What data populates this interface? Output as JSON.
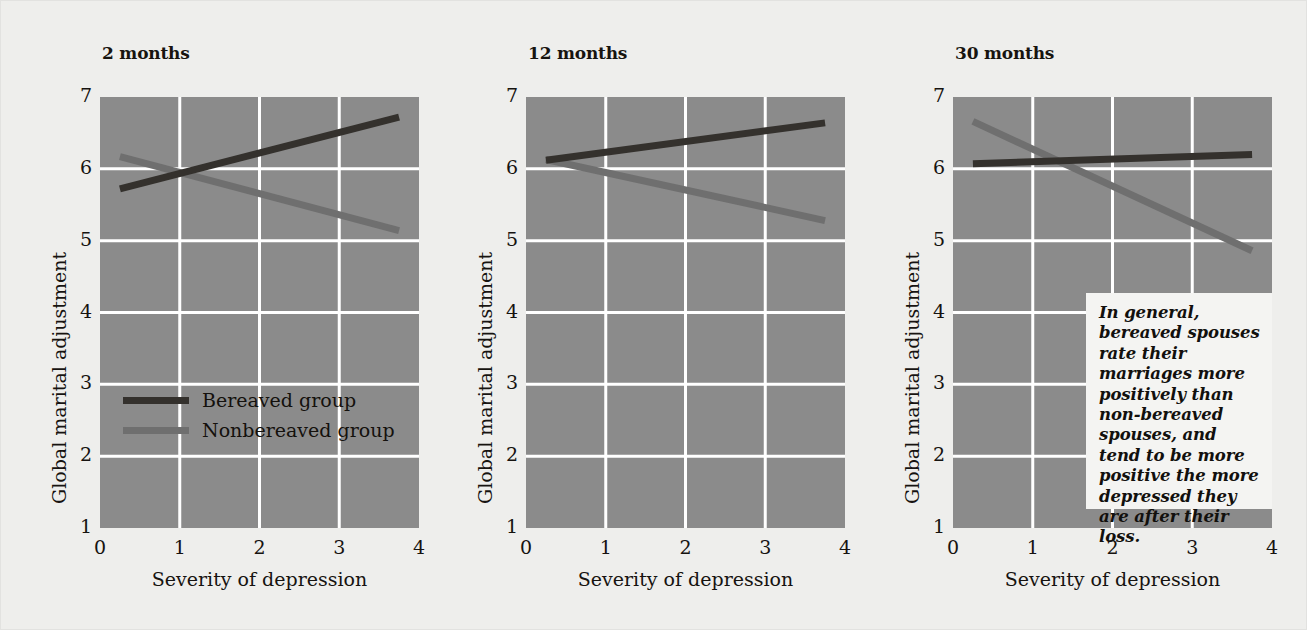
{
  "figure": {
    "background_color": "#eeeeec",
    "plot_background_color": "#8b8b8b",
    "gridline_color": "#ffffff"
  },
  "axes": {
    "xlabel": "Severity of depression",
    "ylabel": "Global marital adjustment",
    "xticks": [
      "0",
      "1",
      "2",
      "3",
      "4"
    ],
    "yticks": [
      "7",
      "6",
      "5",
      "4",
      "3",
      "2",
      "1"
    ]
  },
  "legend": {
    "items": [
      {
        "label": "Bereaved group",
        "color": "#34312d"
      },
      {
        "label": "Nonbereaved group",
        "color": "#6f6f6f"
      }
    ]
  },
  "annotation": {
    "text": "In general, bereaved spouses rate their marriages more positively than non-bereaved spouses, and tend to be more positive the more depressed they are after their loss."
  },
  "panels": [
    {
      "title": "2 months"
    },
    {
      "title": "12 months"
    },
    {
      "title": "30 months"
    }
  ],
  "chart_data": {
    "type": "line",
    "xlabel": "Severity of depression",
    "ylabel": "Global marital adjustment",
    "xlim": [
      0,
      4
    ],
    "ylim": [
      1,
      7
    ],
    "xticks": [
      0,
      1,
      2,
      3,
      4
    ],
    "yticks": [
      1,
      2,
      3,
      4,
      5,
      6,
      7
    ],
    "grid": true,
    "legend_position": "inside-left-panel-lower",
    "panels": [
      {
        "title": "2 months",
        "series": [
          {
            "name": "Bereaved group",
            "color": "#34312d",
            "x": [
              0.25,
              3.75
            ],
            "y": [
              5.72,
              6.72
            ]
          },
          {
            "name": "Nonbereaved group",
            "color": "#6f6f6f",
            "x": [
              0.25,
              3.75
            ],
            "y": [
              6.17,
              5.14
            ]
          }
        ]
      },
      {
        "title": "12 months",
        "series": [
          {
            "name": "Bereaved group",
            "color": "#34312d",
            "x": [
              0.25,
              3.75
            ],
            "y": [
              6.12,
              6.64
            ]
          },
          {
            "name": "Nonbereaved group",
            "color": "#6f6f6f",
            "x": [
              0.25,
              3.75
            ],
            "y": [
              6.13,
              5.28
            ]
          }
        ]
      },
      {
        "title": "30 months",
        "series": [
          {
            "name": "Bereaved group",
            "color": "#34312d",
            "x": [
              0.25,
              3.75
            ],
            "y": [
              6.07,
              6.2
            ]
          },
          {
            "name": "Nonbereaved group",
            "color": "#6f6f6f",
            "x": [
              0.25,
              3.75
            ],
            "y": [
              6.66,
              4.86
            ]
          }
        ]
      }
    ]
  }
}
